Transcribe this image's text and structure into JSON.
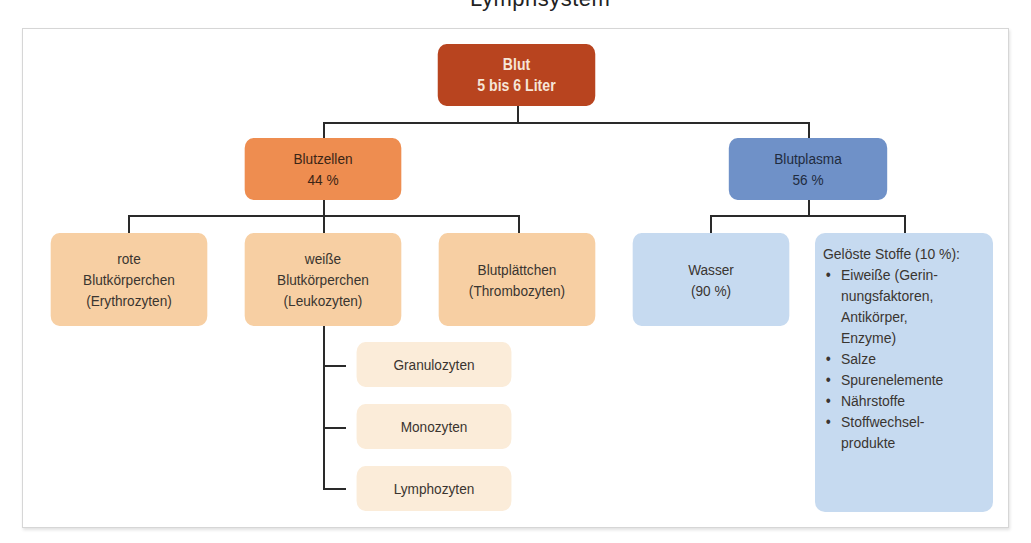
{
  "clipped_title": "Lymphsystem",
  "diagram": {
    "root": {
      "line1": "Blut",
      "line2": "5 bis 6 Liter",
      "color": "#b8441f"
    },
    "cells": {
      "label": "Blutzellen",
      "percent": "44 %",
      "color": "#ee8d50",
      "children": [
        {
          "lines": [
            "rote",
            "Blutkörperchen",
            "(Erythrozyten)"
          ]
        },
        {
          "lines": [
            "weiße",
            "Blutkörperchen",
            "(Leukozyten)"
          ]
        },
        {
          "lines": [
            "Blutplättchen",
            "(Thrombozyten)"
          ]
        }
      ],
      "child_color": "#f7cfa3",
      "leukocyte_types": [
        "Granulozyten",
        "Monozyten",
        "Lymphozyten"
      ],
      "leukocyte_type_color": "#fbecd9"
    },
    "plasma": {
      "label": "Blutplasma",
      "percent": "56 %",
      "color": "#6f91c8",
      "water": {
        "line1": "Wasser",
        "line2": "(90 %)"
      },
      "dissolved": {
        "heading": "Gelöste Stoffe (10 %):",
        "items": [
          [
            "Eiweiße (Gerin-",
            "nungsfaktoren,",
            "Antikörper,",
            "Enzyme)"
          ],
          [
            "Salze"
          ],
          [
            "Spurenelemente"
          ],
          [
            "Nährstoffe"
          ],
          [
            "Stoffwechsel-",
            "produkte"
          ]
        ]
      },
      "child_color": "#c6daf0"
    }
  }
}
